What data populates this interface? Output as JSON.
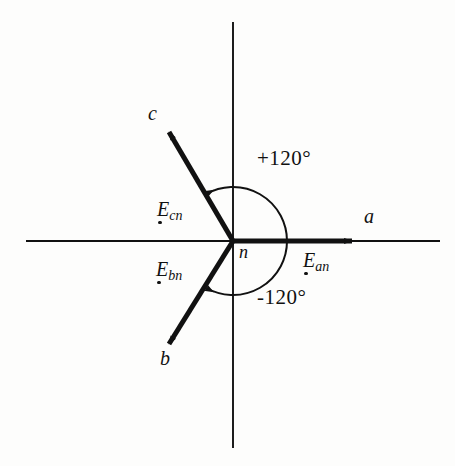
{
  "figure": {
    "type": "phasor-diagram",
    "background_color": "#fdfdfc",
    "ink_color": "#111111"
  },
  "axes": {
    "origin": {
      "x": 233,
      "y": 241
    },
    "horizontal": {
      "x1": 26,
      "y1": 241,
      "x2": 440,
      "y2": 241
    },
    "vertical": {
      "x1": 233,
      "y1": 22,
      "x2": 233,
      "y2": 448
    },
    "origin_label": "n"
  },
  "vectors": [
    {
      "id": "a",
      "terminal_label": "a",
      "phasor_base": "E",
      "phasor_subscript": "an",
      "angle_deg": 0,
      "length_px": 119,
      "tip": {
        "x": 352,
        "y": 241
      },
      "terminal_label_pos": {
        "x": 364,
        "y": 206
      },
      "phasor_label_pos": {
        "x": 303,
        "y": 250
      }
    },
    {
      "id": "b",
      "terminal_label": "b",
      "phasor_base": "E",
      "phasor_subscript": "bn",
      "angle_deg": -120,
      "length_px": 119,
      "tip": {
        "x": 169,
        "y": 344
      },
      "terminal_label_pos": {
        "x": 160,
        "y": 348
      },
      "phasor_label_pos": {
        "x": 156,
        "y": 259
      }
    },
    {
      "id": "c",
      "terminal_label": "c",
      "phasor_base": "E",
      "phasor_subscript": "cn",
      "angle_deg": 120,
      "length_px": 119,
      "tip": {
        "x": 169,
        "y": 132
      },
      "terminal_label_pos": {
        "x": 148,
        "y": 103
      },
      "phasor_label_pos": {
        "x": 157,
        "y": 199
      }
    }
  ],
  "angle_arcs": [
    {
      "id": "plus-120",
      "label": "+120°",
      "value_deg": 120,
      "direction": "counterclockwise",
      "radius_px": 54,
      "label_pos": {
        "x": 257,
        "y": 148
      }
    },
    {
      "id": "minus-120",
      "label": "-120°",
      "value_deg": -120,
      "direction": "clockwise",
      "radius_px": 54,
      "label_pos": {
        "x": 257,
        "y": 287
      }
    }
  ]
}
